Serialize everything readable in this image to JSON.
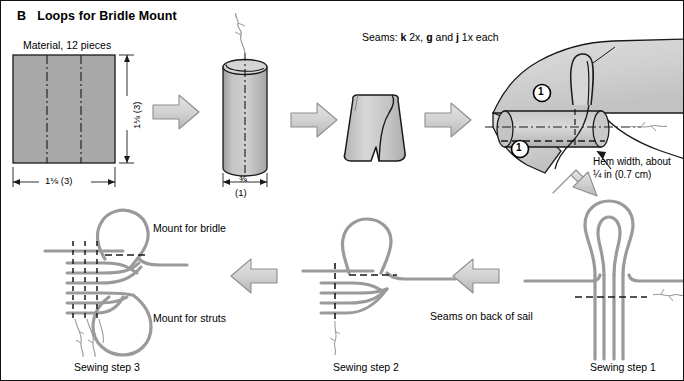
{
  "figure": {
    "panel_letter": "B",
    "title": "Loops for Bridle Mount",
    "border_color": "#111111",
    "background": "#ffffff"
  },
  "colors": {
    "material_fill": "#a8a8a8",
    "tube_fill": "#bdbdbd",
    "sail_fill": "#d0d0d0",
    "arrow_fill": "#d2d2d2",
    "arrow_stroke": "#7a7a7a",
    "strand_color": "#9a9a9a",
    "outline": "#1a1a1a",
    "text": "#000000"
  },
  "top_row": {
    "material": {
      "caption": "Material, 12 pieces",
      "width_dim": "1⅛ (3)",
      "height_dim": "1⅛ (3)",
      "pieces": 12
    },
    "tube": {
      "width_dim": "⅜",
      "width_dim_alt": "(1)"
    },
    "seams_note_prefix": "Seams: ",
    "seams_note": {
      "k": "k",
      "k_qty": " 2x, ",
      "g": "g",
      "and": " and ",
      "j": "j",
      "j_qty": " 1x each"
    },
    "sail": {
      "marker_1": "1",
      "marker_2": "1",
      "hem_line_1": "Hem width, about",
      "hem_line_2": "¼ in (0.7 cm)"
    }
  },
  "bottom_row": {
    "step3": {
      "caption": "Sewing step 3",
      "mount_bridle": "Mount for bridle",
      "mount_struts": "Mount for struts"
    },
    "step2": {
      "caption": "Sewing step 2",
      "back_note": "Seams on back of sail"
    },
    "step1": {
      "caption": "Sewing step 1"
    }
  },
  "arrows": {
    "a1_name": "arrow-right-material-to-tube",
    "a2_name": "arrow-right-tube-to-folded",
    "a3_name": "arrow-right-folded-to-sail",
    "a4_name": "arrow-down-right-sail-to-step1",
    "a5_name": "arrow-left-step1-to-step2",
    "a6_name": "arrow-left-step2-to-step3"
  }
}
